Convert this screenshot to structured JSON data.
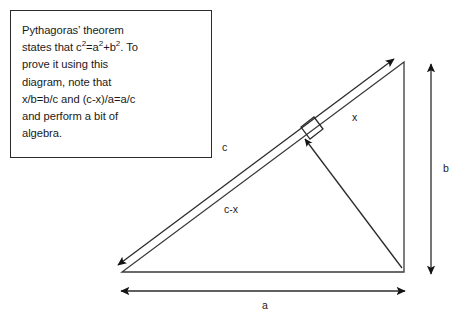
{
  "figure": {
    "background_color": "#ffffff",
    "stroke_color": "#2b2b2b",
    "text_color": "#1a1a1a"
  },
  "caption": {
    "line1": "Pythagoras’ theorem",
    "line2_pre": "states that c",
    "line2_sup1": "2",
    "line2_mid1": "=a",
    "line2_sup2": "2",
    "line2_mid2": "+b",
    "line2_sup3": "2",
    "line2_post": ". To",
    "line3": "prove it using this",
    "line4": "diagram, note that",
    "line5": "x/b=b/c and (c-x)/a=a/c",
    "line6": "and perform a bit of",
    "line7": "algebra."
  },
  "diagram": {
    "type": "geometry-proof-diagram",
    "labels": {
      "hypotenuse": "c",
      "lower_segment": "c-x",
      "upper_segment": "x",
      "vertical_side": "b",
      "horizontal_side": "a"
    },
    "vertices": {
      "bottom_left": [
        122,
        272
      ],
      "bottom_right": [
        404,
        272
      ],
      "top_right": [
        404,
        62
      ]
    },
    "altitude_foot": [
      307,
      137
    ],
    "right_angle_marker": "square",
    "arrows": {
      "c_double_arrow": {
        "from": [
          120,
          270
        ],
        "to": [
          396,
          61
        ],
        "heads": "both"
      },
      "altitude_arrow": {
        "from": [
          402,
          268
        ],
        "to": [
          303,
          140
        ],
        "heads": "start"
      },
      "b_arrow": {
        "from": [
          431,
          63
        ],
        "to": [
          431,
          275
        ],
        "heads": "both"
      },
      "a_arrow": {
        "from": [
          120,
          291
        ],
        "to": [
          406,
          291
        ],
        "heads": "both"
      }
    }
  }
}
